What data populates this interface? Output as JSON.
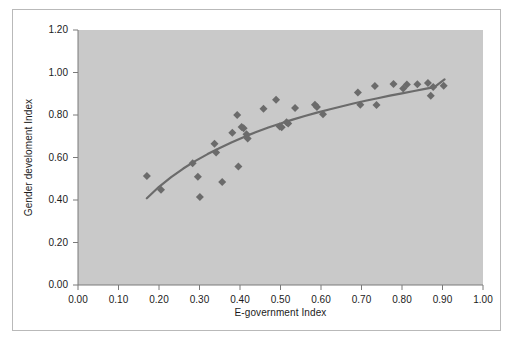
{
  "figure": {
    "background_color": "#ffffff",
    "frame_color": "#b9b9b9"
  },
  "chart_data": {
    "type": "scatter",
    "title": "",
    "subtitle": "",
    "xlabel": "E-government Index",
    "ylabel": "Gender develoment Index",
    "xlim": [
      0.0,
      1.0
    ],
    "ylim": [
      0.0,
      1.2
    ],
    "xticks": [
      "0.00",
      "0.10",
      "0.20",
      "0.30",
      "0.40",
      "0.50",
      "0.60",
      "0.70",
      "0.80",
      "0.90",
      "1.00"
    ],
    "xtick_values": [
      0.0,
      0.1,
      0.2,
      0.3,
      0.4,
      0.5,
      0.6,
      0.7,
      0.8,
      0.9,
      1.0
    ],
    "yticks": [
      "0.00",
      "0.20",
      "0.40",
      "0.60",
      "0.80",
      "1.00",
      "1.20"
    ],
    "ytick_values": [
      0.0,
      0.2,
      0.4,
      0.6,
      0.8,
      1.0,
      1.2
    ],
    "grid": false,
    "legend": null,
    "plot_background_color": "#c9c9c9",
    "marker_color": "#6b6b6b",
    "marker_shape": "diamond",
    "marker_size": 4,
    "trendline": {
      "color": "#6b6b6b",
      "width": 2.2,
      "style": "solid",
      "kind": "logarithmic",
      "points": [
        [
          0.17,
          0.408
        ],
        [
          0.2,
          0.462
        ],
        [
          0.23,
          0.508
        ],
        [
          0.26,
          0.548
        ],
        [
          0.29,
          0.584
        ],
        [
          0.32,
          0.616
        ],
        [
          0.35,
          0.645
        ],
        [
          0.38,
          0.672
        ],
        [
          0.41,
          0.697
        ],
        [
          0.44,
          0.72
        ],
        [
          0.47,
          0.741
        ],
        [
          0.5,
          0.76
        ],
        [
          0.53,
          0.778
        ],
        [
          0.56,
          0.795
        ],
        [
          0.59,
          0.811
        ],
        [
          0.62,
          0.826
        ],
        [
          0.65,
          0.84
        ],
        [
          0.68,
          0.854
        ],
        [
          0.71,
          0.867
        ],
        [
          0.74,
          0.879
        ],
        [
          0.77,
          0.891
        ],
        [
          0.8,
          0.902
        ],
        [
          0.83,
          0.913
        ],
        [
          0.86,
          0.924
        ],
        [
          0.88,
          0.931
        ],
        [
          0.905,
          0.968
        ]
      ]
    },
    "points": [
      [
        0.17,
        0.513
      ],
      [
        0.205,
        0.448
      ],
      [
        0.283,
        0.573
      ],
      [
        0.296,
        0.51
      ],
      [
        0.301,
        0.414
      ],
      [
        0.337,
        0.665
      ],
      [
        0.341,
        0.623
      ],
      [
        0.356,
        0.485
      ],
      [
        0.381,
        0.717
      ],
      [
        0.393,
        0.8
      ],
      [
        0.396,
        0.558
      ],
      [
        0.404,
        0.744
      ],
      [
        0.409,
        0.738
      ],
      [
        0.416,
        0.71
      ],
      [
        0.419,
        0.69
      ],
      [
        0.458,
        0.83
      ],
      [
        0.489,
        0.872
      ],
      [
        0.498,
        0.746
      ],
      [
        0.503,
        0.742
      ],
      [
        0.515,
        0.766
      ],
      [
        0.519,
        0.76
      ],
      [
        0.536,
        0.833
      ],
      [
        0.585,
        0.848
      ],
      [
        0.59,
        0.838
      ],
      [
        0.605,
        0.803
      ],
      [
        0.691,
        0.906
      ],
      [
        0.697,
        0.848
      ],
      [
        0.733,
        0.936
      ],
      [
        0.737,
        0.847
      ],
      [
        0.779,
        0.946
      ],
      [
        0.803,
        0.925
      ],
      [
        0.812,
        0.943
      ],
      [
        0.838,
        0.945
      ],
      [
        0.864,
        0.951
      ],
      [
        0.871,
        0.891
      ],
      [
        0.877,
        0.932
      ],
      [
        0.903,
        0.938
      ]
    ]
  }
}
